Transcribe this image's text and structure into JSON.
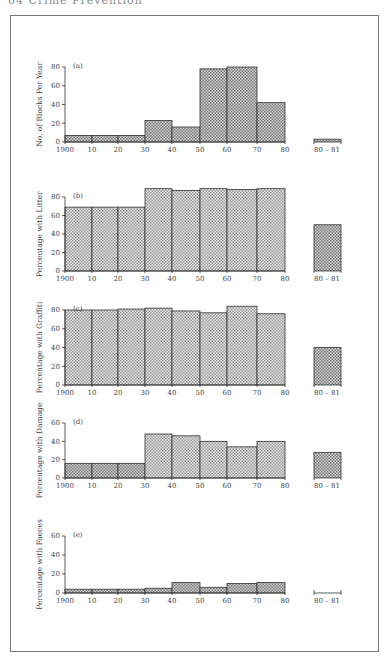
{
  "page": {
    "header": "64   Crime Prevention"
  },
  "chart_data": [
    {
      "type": "bar",
      "panel": "(a)",
      "ylabel": "No. of Blocks Per Year",
      "xlabel": "",
      "categories": [
        "1900-10",
        "10-20",
        "20-30",
        "30-40",
        "40-50",
        "50-60",
        "60-70",
        "70-80",
        "80-81"
      ],
      "x_tick_labels": [
        "1900",
        "10",
        "20",
        "30",
        "40",
        "50",
        "60",
        "70",
        "80",
        "80-81"
      ],
      "y_ticks": [
        0,
        20,
        40,
        60,
        80
      ],
      "ylim": [
        0,
        80
      ],
      "values": [
        7,
        7,
        7,
        23,
        16,
        78,
        80,
        42,
        3
      ]
    },
    {
      "type": "bar",
      "panel": "(b)",
      "ylabel": "Percentage with Litter",
      "xlabel": "",
      "categories": [
        "1900-10",
        "10-20",
        "20-30",
        "30-40",
        "40-50",
        "50-60",
        "60-70",
        "70-80",
        "80-81"
      ],
      "x_tick_labels": [
        "1900",
        "10",
        "20",
        "30",
        "40",
        "50",
        "60",
        "70",
        "80",
        "80-81"
      ],
      "y_ticks": [
        0,
        20,
        40,
        60,
        80
      ],
      "ylim": [
        0,
        90
      ],
      "values": [
        69,
        69,
        69,
        89,
        87,
        89,
        88,
        89,
        50
      ]
    },
    {
      "type": "bar",
      "panel": "(c)",
      "ylabel": "Percentage with Graffiti",
      "xlabel": "",
      "categories": [
        "1900-10",
        "10-20",
        "20-30",
        "30-40",
        "40-50",
        "50-60",
        "60-70",
        "70-80",
        "80-81"
      ],
      "x_tick_labels": [
        "1900",
        "10",
        "20",
        "30",
        "40",
        "50",
        "60",
        "70",
        "80",
        "80-81"
      ],
      "y_ticks": [
        0,
        20,
        40,
        60,
        80
      ],
      "ylim": [
        0,
        85
      ],
      "values": [
        80,
        80,
        81,
        82,
        79,
        77,
        84,
        76,
        40
      ]
    },
    {
      "type": "bar",
      "panel": "(d)",
      "ylabel": "Percentage with Damage",
      "xlabel": "",
      "categories": [
        "1900-10",
        "10-20",
        "20-30",
        "30-40",
        "40-50",
        "50-60",
        "60-70",
        "70-80",
        "80-81"
      ],
      "x_tick_labels": [
        "1900",
        "10",
        "20",
        "30",
        "40",
        "50",
        "60",
        "70",
        "80",
        "80-81"
      ],
      "y_ticks": [
        0,
        20,
        40,
        60
      ],
      "ylim": [
        0,
        60
      ],
      "values": [
        16,
        16,
        16,
        48,
        46,
        40,
        34,
        40,
        28
      ]
    },
    {
      "type": "bar",
      "panel": "(e)",
      "ylabel": "Percentage with Faeces",
      "xlabel": "",
      "categories": [
        "1900-10",
        "10-20",
        "20-30",
        "30-40",
        "40-50",
        "50-60",
        "60-70",
        "70-80",
        "80-81"
      ],
      "x_tick_labels": [
        "1900",
        "10",
        "20",
        "30",
        "40",
        "50",
        "60",
        "70",
        "80",
        "80-81"
      ],
      "y_ticks": [
        0,
        20,
        40,
        60
      ],
      "ylim": [
        0,
        60
      ],
      "values": [
        4,
        4,
        4,
        5,
        11,
        6,
        10,
        11,
        0
      ]
    }
  ],
  "layout": {
    "x_positions": [
      65,
      92,
      118,
      145,
      172,
      200,
      227,
      257,
      285
    ],
    "extra_bar": [
      314,
      341
    ],
    "extra_label_x": 327,
    "panels": [
      {
        "y0": 142,
        "ytop": 67,
        "ymax": 80
      },
      {
        "y0": 271,
        "ytop": 197,
        "ymax": 80
      },
      {
        "y0": 385,
        "ytop": 310,
        "ymax": 80
      },
      {
        "y0": 478,
        "ytop": 423,
        "ymax": 60
      },
      {
        "y0": 593,
        "ytop": 536,
        "ymax": 60
      }
    ],
    "colors": {
      "bar_fill": "#cfcfcf",
      "bar_fill_dark": "#b9b9b9",
      "bar_stroke": "#333333",
      "axis": "#333333"
    }
  }
}
